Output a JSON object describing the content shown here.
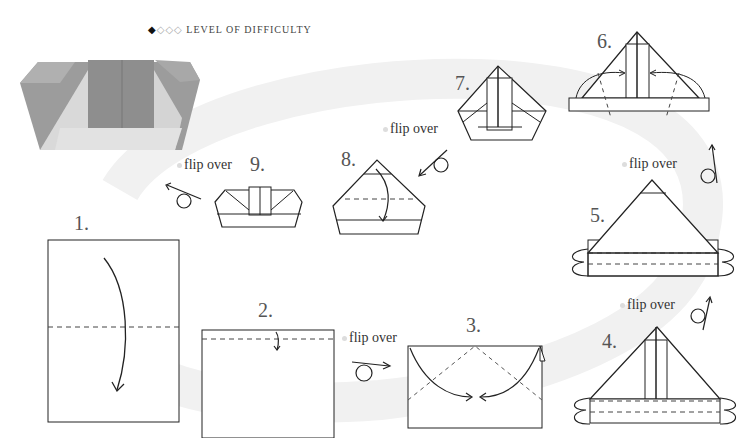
{
  "header": {
    "difficulty_filled": "◆",
    "difficulty_empty": "◇◇◇",
    "difficulty_label": "LEVEL OF DIFFICULTY",
    "difficulty_level": 1,
    "difficulty_max": 4
  },
  "photo": {
    "subject": "finished-origami-photo",
    "colors": {
      "dark": "#9a9a9a",
      "light": "#d8d8d8"
    }
  },
  "steps": [
    {
      "number": "1.",
      "action": "fold-down"
    },
    {
      "number": "2.",
      "action": "fold-top-edge"
    },
    {
      "number": "3.",
      "action": "fold-corners-to-center"
    },
    {
      "number": "4.",
      "action": "fold-bottom-strips"
    },
    {
      "number": "5.",
      "action": "fold-bottom-strips"
    },
    {
      "number": "6.",
      "action": "fold-sides-in"
    },
    {
      "number": "7.",
      "action": "result"
    },
    {
      "number": "8.",
      "action": "fold-tip-down"
    },
    {
      "number": "9.",
      "action": "result"
    }
  ],
  "flip_labels": {
    "between_2_3": "flip over",
    "between_4_5": "flip over",
    "between_5_6": "flip over",
    "between_7_8": "flip over",
    "after_9": "flip over"
  },
  "colors": {
    "line": "#222222",
    "swirl": "#f2f2f2",
    "photo_dark": "#9a9a9a",
    "photo_light": "#dcdcdc"
  }
}
